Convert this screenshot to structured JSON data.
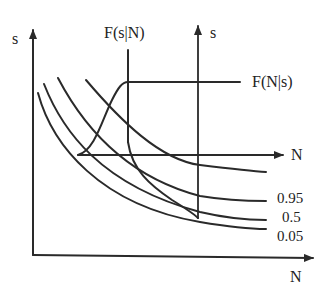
{
  "diagram": {
    "main_axes": {
      "y_label": "s",
      "x_label": "N"
    },
    "inset_axes": {
      "y_label": "s",
      "x_label": "N"
    },
    "distribution_labels": {
      "conditional_s_given_N": "F(s|N)",
      "conditional_N_given_s": "F(N|s)"
    },
    "curves": [
      {
        "name": "upper-curve",
        "label": ""
      },
      {
        "name": "quantile-0.95",
        "label": "0.95"
      },
      {
        "name": "quantile-0.5",
        "label": "0.5"
      },
      {
        "name": "quantile-0.05",
        "label": "0.05"
      }
    ],
    "colors": {
      "ink": "#2a2a2a",
      "background": "#ffffff"
    }
  }
}
